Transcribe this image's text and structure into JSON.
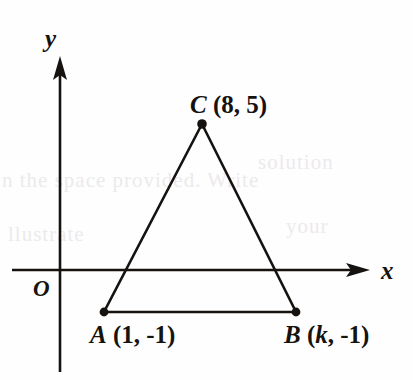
{
  "figure": {
    "kind": "coordinate-plane-triangle",
    "background_color": "#fefefe",
    "ink_color": "#15120f"
  },
  "axes": {
    "x_label": "x",
    "y_label": "y",
    "origin_label": "O",
    "x_axis_name": "x-axis",
    "y_axis_name": "y-axis",
    "x_arrow_direction": "right",
    "y_arrow_direction": "up"
  },
  "points": {
    "a": {
      "name": "A",
      "coords": "(1, -1)",
      "full_label": "A (1, -1)",
      "x_value": "1",
      "y_value": "-1"
    },
    "b": {
      "name": "B",
      "coords_open": "(",
      "coords_var": "k",
      "coords_rest": ", -1)",
      "full_label": "B (k, -1)",
      "x_value": "k",
      "y_value": "-1"
    },
    "c": {
      "name": "C",
      "coords": "(8, 5)",
      "full_label": "C (8, 5)",
      "x_value": "8",
      "y_value": "5"
    }
  },
  "shape": {
    "type": "triangle",
    "vertices": [
      "A",
      "B",
      "C"
    ],
    "sides": [
      "AB",
      "BC",
      "CA"
    ]
  },
  "bleed_through": {
    "line_1": "n the space provided. Write",
    "line_2": "solution",
    "line_3": "llustrate",
    "line_4": "your"
  }
}
